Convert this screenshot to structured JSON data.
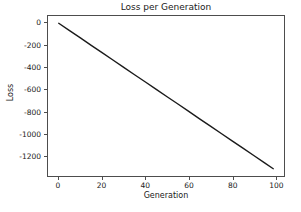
{
  "figure": {
    "background_color": "#ffffff",
    "width": 301,
    "height": 212
  },
  "chart_data": {
    "type": "line",
    "title": "Loss per Generation",
    "xlabel": "Generation",
    "ylabel": "Loss",
    "grid": false,
    "legend": null,
    "line_color": "#1a1a1a",
    "line_width": 1.4,
    "xlim": [
      -4.95,
      103.95
    ],
    "ylim": [
      -1386,
      66
    ],
    "xticks": [
      0,
      20,
      40,
      60,
      80,
      100
    ],
    "xtick_labels": [
      "0",
      "20",
      "40",
      "60",
      "80",
      "100"
    ],
    "yticks": [
      0,
      -200,
      -400,
      -600,
      -800,
      -1000,
      -1200
    ],
    "ytick_labels": [
      "0",
      "-200",
      "-400",
      "-600",
      "-800",
      "-1000",
      "-1200"
    ],
    "series": [
      {
        "name": "loss",
        "x": [
          0,
          5,
          10,
          15,
          20,
          25,
          30,
          35,
          40,
          45,
          50,
          55,
          60,
          65,
          70,
          75,
          80,
          85,
          90,
          95,
          99
        ],
        "values": [
          0,
          -67,
          -133,
          -200,
          -267,
          -333,
          -400,
          -467,
          -533,
          -600,
          -667,
          -733,
          -800,
          -867,
          -933,
          -1000,
          -1067,
          -1133,
          -1200,
          -1267,
          -1320
        ]
      }
    ]
  }
}
